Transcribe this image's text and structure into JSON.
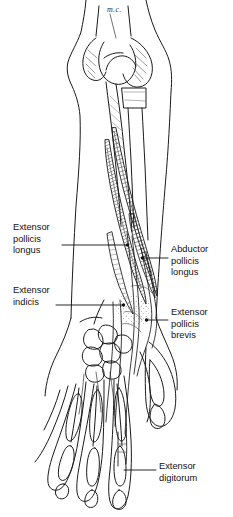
{
  "figure": {
    "kind": "anatomical-line-drawing",
    "view": "posterior forearm and hand",
    "style": "black ink line art with hatched muscle shading on white background",
    "ink_color": "#1a1a1a",
    "background_color": "#ffffff",
    "annotation_script": "m.c."
  },
  "labels": {
    "extensor_pollicis_longus": {
      "lines": [
        "Extensor",
        "pollicis",
        "longus"
      ],
      "side": "left"
    },
    "extensor_indicis": {
      "lines": [
        "Extensor",
        "indicis"
      ],
      "side": "left"
    },
    "abductor_pollicis_longus": {
      "lines": [
        "Abductor",
        "pollicis",
        "longus"
      ],
      "side": "right"
    },
    "extensor_pollicis_brevis": {
      "lines": [
        "Extensor",
        "pollicis",
        "brevis"
      ],
      "side": "right"
    },
    "extensor_digitorum": {
      "lines": [
        "Extensor",
        "digitorum"
      ],
      "side": "right"
    }
  }
}
